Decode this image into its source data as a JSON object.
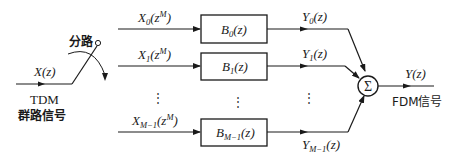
{
  "diagram": {
    "type": "TDM-to-FDM transmultiplexer block diagram",
    "input": {
      "signal": "X(z)",
      "caption_line1": "TDM",
      "caption_line2": "群路信号"
    },
    "switch": {
      "label": "分路"
    },
    "branches": [
      {
        "input_base": "X",
        "input_sub": "0",
        "input_arg": "(z",
        "input_sup": "M",
        "input_close": ")",
        "filter_base": "B",
        "filter_sub": "0",
        "filter_arg": "(z)",
        "output_base": "Y",
        "output_sub": "0",
        "output_arg": "(z)"
      },
      {
        "input_base": "X",
        "input_sub": "1",
        "input_arg": "(z",
        "input_sup": "M",
        "input_close": ")",
        "filter_base": "B",
        "filter_sub": "1",
        "filter_arg": "(z)",
        "output_base": "Y",
        "output_sub": "1",
        "output_arg": "(z)"
      },
      {
        "input_base": "X",
        "input_sub": "M−1",
        "input_arg": "(z",
        "input_sup": "M",
        "input_close": ")",
        "filter_base": "B",
        "filter_sub": "M−1",
        "filter_arg": "(z)",
        "output_base": "Y",
        "output_sub": "M−1",
        "output_arg": "(z)"
      }
    ],
    "ellipsis": "⋮",
    "summer": {
      "symbol": "Σ"
    },
    "output": {
      "signal": "Y(z)",
      "caption": "FDM信号"
    }
  }
}
